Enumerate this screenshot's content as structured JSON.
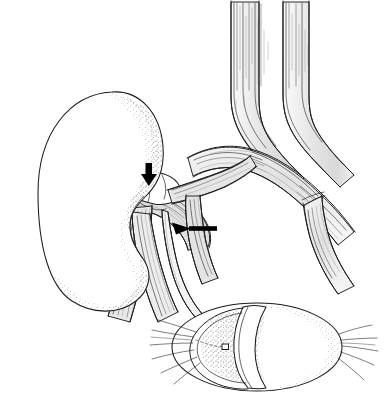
{
  "figure": {
    "title": "Renal vasculature and bladder surgical illustration",
    "style": "pen-and-ink medical line drawing",
    "background_color": "#ffffff",
    "ink_color": "#1b1b1b",
    "fill_gray": "#e3e3e3",
    "stipple_color": "#5a5a5a",
    "width": 387,
    "height": 401
  },
  "structures": {
    "kidney": {
      "label": "kidney",
      "description": "large bean-shaped organ at left with stippled medial border and hilar notch",
      "fill": "#ffffff",
      "outline": "#1b1b1b"
    },
    "aorta": {
      "label": "aorta",
      "description": "vertical great vessel descending at upper center, bifurcating into common iliac arteries",
      "fill": "#e6e6e6"
    },
    "vena_cava": {
      "label": "inferior-vena-cava",
      "description": "vertical great vessel to the right of the aorta",
      "fill": "#efefef"
    },
    "iliac_vessels": {
      "label": "common-iliac-vessels",
      "description": "vessels curving inferolaterally from bifurcation toward the right lower field",
      "fill": "#e8e8e8"
    },
    "renal_pedicle": {
      "label": "renal-pedicle",
      "description": "bundle of renal artery and renal vein entering the kidney hilum",
      "fill": "#dedede"
    },
    "transected_vein_stump": {
      "label": "transected-renal-vein-stump",
      "description": "cut vessel end with suture line at the hilum, indicated by the vertical arrow",
      "fill": "#f2f2f2"
    },
    "ureter": {
      "label": "ureter",
      "description": "slender tube descending from the renal hilum and curving toward the bladder",
      "fill": "#f4f4f4"
    },
    "bladder": {
      "label": "urinary-bladder",
      "description": "ellipsoid organ at lower right shown with an anterior cut-away flap exposing the lumen",
      "fill": "#ffffff"
    },
    "bladder_flap": {
      "label": "bladder-cutaway-flap",
      "description": "reflected anterior wall segment of the bladder",
      "fill": "#ffffff"
    },
    "ureteral_orifice": {
      "label": "ureteral-orifice",
      "description": "small square marker inside the bladder lumen indicating the ureteral meatus"
    },
    "bladder_attachments": {
      "label": "bladder-fibrous-attachments",
      "description": "radiating fibrous strands at both poles of the bladder"
    }
  },
  "annotations": {
    "arrows": [
      {
        "id": "arrow-down",
        "name": "vertical-annotation-arrow",
        "direction": "down",
        "points_to": "transected-renal-vein-stump",
        "color": "#000000",
        "x": 149,
        "y": 170
      },
      {
        "id": "arrow-left",
        "name": "horizontal-annotation-arrow",
        "direction": "left",
        "points_to": "renal-pedicle-anastomosis",
        "color": "#000000",
        "x": 178,
        "y": 228
      }
    ],
    "caption": ""
  }
}
